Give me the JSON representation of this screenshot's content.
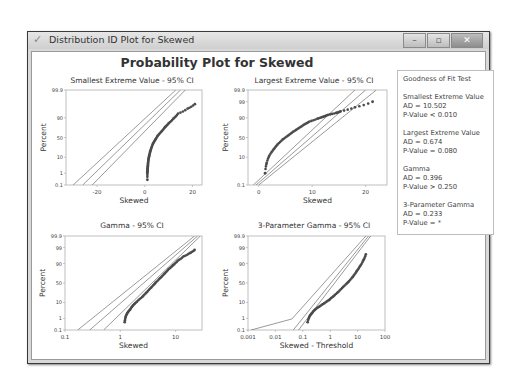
{
  "window": {
    "title": "Distribution ID Plot for Skewed",
    "buttons": {
      "minimize": "–",
      "maximize": "▫",
      "close": "✕"
    }
  },
  "figure_title": "Probability Plot for Skewed",
  "legend": {
    "title": "Goodness of Fit Test",
    "groups": [
      {
        "name": "Smallest Extreme Value",
        "ad": "AD = 10.502",
        "p": "P-Value < 0.010"
      },
      {
        "name": "Largest Extreme Value",
        "ad": "AD = 0.674",
        "p": "P-Value = 0.080"
      },
      {
        "name": "Gamma",
        "ad": "AD = 0.396",
        "p": "P-Value > 0.250"
      },
      {
        "name": "3-Parameter Gamma",
        "ad": "AD = 0.233",
        "p": "P-Value = *"
      }
    ]
  },
  "colors": {
    "line": "#6e6e6e",
    "point": "#4a4a4a",
    "frame": "#b0b0b0"
  },
  "chart_data": [
    {
      "type": "scatter",
      "title": "Smallest Extreme Value - 95% CI",
      "xlabel": "Skewed",
      "ylabel": "Percent",
      "x_scale": "linear",
      "xlim": [
        -33,
        24
      ],
      "x_ticks": [
        -20,
        0,
        20
      ],
      "y_ticks": [
        "0.1",
        "1",
        "10",
        "50",
        "90",
        "99.9"
      ],
      "fit_line": [
        [
          -26,
          0.1
        ],
        [
          15,
          99.9
        ]
      ],
      "ci_lower": [
        [
          -30,
          0.1
        ],
        [
          13,
          99.9
        ]
      ],
      "ci_upper": [
        [
          -22,
          0.1
        ],
        [
          17,
          99.9
        ]
      ],
      "points": [
        [
          1.1,
          0.3
        ],
        [
          1.1,
          1.2
        ],
        [
          1.2,
          2
        ],
        [
          1.3,
          3
        ],
        [
          1.4,
          5
        ],
        [
          1.6,
          8
        ],
        [
          1.9,
          12
        ],
        [
          2.3,
          18
        ],
        [
          2.8,
          25
        ],
        [
          3.5,
          35
        ],
        [
          4.5,
          45
        ],
        [
          5.5,
          55
        ],
        [
          7,
          65
        ],
        [
          8.5,
          75
        ],
        [
          10,
          82
        ],
        [
          12,
          89
        ],
        [
          14,
          94
        ],
        [
          18,
          97
        ],
        [
          21,
          98.5
        ]
      ],
      "grid": false
    },
    {
      "type": "scatter",
      "title": "Largest Extreme Value - 95% CI",
      "xlabel": "Skewed",
      "ylabel": "Percent",
      "x_scale": "linear",
      "xlim": [
        -2,
        24
      ],
      "x_ticks": [
        0,
        10,
        20
      ],
      "y_ticks": [
        "0.1",
        "10",
        "50",
        "90",
        "99",
        "99.9"
      ],
      "fit_line": [
        [
          -0.5,
          0.1
        ],
        [
          20,
          99.9
        ]
      ],
      "ci_lower": [
        [
          -1,
          0.1
        ],
        [
          18,
          99.9
        ]
      ],
      "ci_upper": [
        [
          0,
          0.1
        ],
        [
          22,
          99.9
        ]
      ],
      "points": [
        [
          1.2,
          1
        ],
        [
          1.5,
          5
        ],
        [
          2,
          12
        ],
        [
          2.8,
          22
        ],
        [
          3.5,
          32
        ],
        [
          4.5,
          45
        ],
        [
          5.5,
          55
        ],
        [
          6.5,
          65
        ],
        [
          7.5,
          73
        ],
        [
          8.5,
          80
        ],
        [
          9.5,
          85
        ],
        [
          11,
          89
        ],
        [
          12,
          91
        ],
        [
          13,
          93
        ],
        [
          14.5,
          94.5
        ],
        [
          15.3,
          95.5
        ],
        [
          18,
          97.5
        ],
        [
          21.3,
          99
        ]
      ],
      "grid": false
    },
    {
      "type": "scatter",
      "title": "Gamma - 95% CI",
      "xlabel": "Skewed",
      "ylabel": "Percent",
      "x_scale": "log",
      "xlim": [
        0.1,
        30
      ],
      "x_ticks": [
        0.1,
        1,
        10
      ],
      "y_ticks": [
        "0.1",
        "1",
        "10",
        "50",
        "90",
        "99",
        "99.9"
      ],
      "fit_line": [
        [
          0.28,
          0.1
        ],
        [
          25,
          99.9
        ]
      ],
      "ci_lower": [
        [
          0.17,
          0.1
        ],
        [
          22,
          99.9
        ]
      ],
      "ci_upper": [
        [
          0.5,
          0.1
        ],
        [
          28,
          99.9
        ]
      ],
      "points": [
        [
          1.2,
          0.5
        ],
        [
          1.25,
          1.3
        ],
        [
          1.35,
          2.5
        ],
        [
          1.5,
          4
        ],
        [
          1.7,
          7
        ],
        [
          2,
          11
        ],
        [
          2.5,
          18
        ],
        [
          3,
          27
        ],
        [
          3.6,
          38
        ],
        [
          4.3,
          50
        ],
        [
          5.2,
          62
        ],
        [
          6.3,
          73
        ],
        [
          7.5,
          82
        ],
        [
          9,
          88
        ],
        [
          11,
          93
        ],
        [
          14,
          96
        ],
        [
          18,
          97.5
        ],
        [
          22,
          98.5
        ]
      ],
      "grid": false
    },
    {
      "type": "scatter",
      "title": "3-Parameter Gamma - 95% CI",
      "xlabel": "Skewed - Threshold",
      "ylabel": "Percent",
      "x_scale": "log",
      "xlim": [
        0.001,
        100
      ],
      "x_ticks": [
        0.001,
        0.01,
        0.1,
        1,
        10,
        100
      ],
      "y_ticks": [
        "0.1",
        "1",
        "10",
        "50",
        "90",
        "99",
        "99.9"
      ],
      "fit_line": [
        [
          0.045,
          0.1
        ],
        [
          25,
          99.9
        ]
      ],
      "ci_lower": [
        [
          0.0013,
          0.1
        ],
        [
          0.04,
          0.9
        ],
        [
          20,
          99.9
        ]
      ],
      "ci_upper": [
        [
          0.07,
          0.1
        ],
        [
          30,
          99.9
        ]
      ],
      "points": [
        [
          0.15,
          0.5
        ],
        [
          0.18,
          1.5
        ],
        [
          0.22,
          2.5
        ],
        [
          0.28,
          4
        ],
        [
          0.4,
          6
        ],
        [
          0.6,
          9
        ],
        [
          0.9,
          13
        ],
        [
          1.3,
          19
        ],
        [
          2,
          28
        ],
        [
          3,
          40
        ],
        [
          4.5,
          52
        ],
        [
          6.5,
          65
        ],
        [
          9,
          77
        ],
        [
          12,
          86
        ],
        [
          16,
          93
        ],
        [
          20,
          97
        ]
      ],
      "grid": false
    }
  ]
}
